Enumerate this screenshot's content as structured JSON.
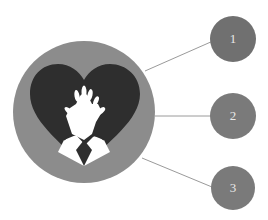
{
  "diagram": {
    "center_icon": "heart-hands-cpr-icon",
    "nodes": [
      {
        "label": "1",
        "color": "#707070"
      },
      {
        "label": "2",
        "color": "#7a7a7a"
      },
      {
        "label": "3",
        "color": "#7a7a7a"
      }
    ],
    "colors": {
      "outer_ring": "#8c8c8c",
      "heart": "#2e2e2e",
      "hands": "#ffffff",
      "connector": "#9a9a9a"
    }
  }
}
